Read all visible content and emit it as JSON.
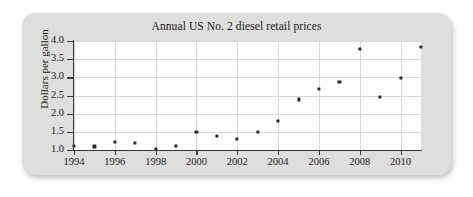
{
  "figure": {
    "title": "Annual US No. 2 diesel retail prices"
  },
  "axes": {
    "ylabel": "Dollars per gallon",
    "xlabel": "",
    "yticks": [
      "1.0",
      "1.5",
      "2.0",
      "2.5",
      "3.0",
      "3.5",
      "4.0"
    ],
    "xticks": [
      "1994",
      "1996",
      "1998",
      "2000",
      "2002",
      "2004",
      "2006",
      "2008",
      "2010"
    ]
  },
  "colors": {
    "card_background": "#dededd",
    "plot_background": "#ffffff",
    "marker": "#2a2a2a",
    "gridline": "#d8d8d8",
    "axis": "#3a3a3a",
    "text": "#1b1b1b"
  },
  "chart_data": {
    "type": "scatter",
    "title": "Annual US No. 2 diesel retail prices",
    "xlabel": "",
    "ylabel": "Dollars per gallon",
    "xlim": [
      1994,
      2011
    ],
    "ylim": [
      1.0,
      4.0
    ],
    "grid": true,
    "legend": false,
    "x": [
      1994,
      1995,
      1996,
      1997,
      1998,
      1999,
      2000,
      2001,
      2002,
      2003,
      2004,
      2005,
      2006,
      2007,
      2008,
      2009,
      2010,
      2011
    ],
    "values": [
      1.11,
      1.1,
      1.22,
      1.19,
      1.03,
      1.11,
      1.49,
      1.39,
      1.31,
      1.5,
      1.8,
      2.39,
      2.69,
      2.88,
      3.79,
      2.46,
      2.98,
      3.83
    ],
    "xtick_values": [
      1994,
      1996,
      1998,
      2000,
      2002,
      2004,
      2006,
      2008,
      2010
    ],
    "ytick_values": [
      1.0,
      1.5,
      2.0,
      2.5,
      3.0,
      3.5,
      4.0
    ]
  }
}
